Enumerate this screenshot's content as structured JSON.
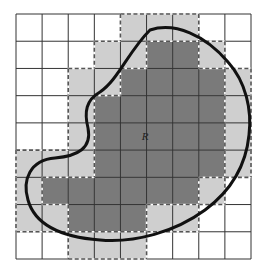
{
  "figure": {
    "region_label": "R",
    "grid": {
      "rows": 9,
      "cols": 9,
      "cells": [
        [
          0,
          0,
          0,
          0,
          1,
          1,
          1,
          0,
          0
        ],
        [
          0,
          0,
          0,
          1,
          1,
          2,
          2,
          1,
          0
        ],
        [
          0,
          0,
          1,
          1,
          2,
          2,
          2,
          2,
          1
        ],
        [
          0,
          0,
          1,
          2,
          2,
          2,
          2,
          2,
          1
        ],
        [
          0,
          0,
          1,
          2,
          2,
          2,
          2,
          2,
          1
        ],
        [
          1,
          1,
          1,
          2,
          2,
          2,
          2,
          2,
          1
        ],
        [
          1,
          2,
          2,
          2,
          2,
          2,
          2,
          1,
          0
        ],
        [
          1,
          1,
          2,
          2,
          2,
          1,
          1,
          0,
          0
        ],
        [
          0,
          0,
          1,
          1,
          1,
          0,
          0,
          0,
          0
        ]
      ],
      "legend": {
        "0": "outside region",
        "1": "partially inside region (outer approximation)",
        "2": "fully inside region (inner approximation)"
      }
    },
    "colors": {
      "background": "#ffffff",
      "outer_cells": "#cfcfcf",
      "inner_cells": "#7a7a7a",
      "grid_lines": "#333333",
      "dashed_boundary": "#555555",
      "curve": "#111111"
    }
  }
}
